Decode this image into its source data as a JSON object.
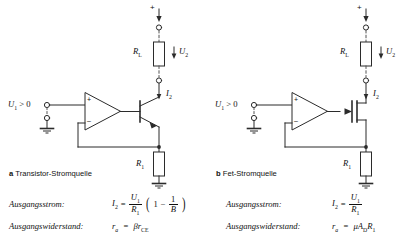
{
  "figure": {
    "panels": [
      {
        "id": "a",
        "marker": "a",
        "caption": "Transistor-Stromquelle",
        "supply_label": "+",
        "load_resistor": "R",
        "load_resistor_sub": "L",
        "load_voltage": "U",
        "load_voltage_sub": "2",
        "output_current": "I",
        "output_current_sub": "2",
        "input_label": "U",
        "input_label_sub": "1",
        "input_condition": "> 0",
        "opamp_plus": "+",
        "opamp_minus": "–",
        "emitter_resistor": "R",
        "emitter_resistor_sub": "1",
        "device": "npn-transistor"
      },
      {
        "id": "b",
        "marker": "b",
        "caption": "Fet-Stromquelle",
        "supply_label": "+",
        "load_resistor": "R",
        "load_resistor_sub": "L",
        "load_voltage": "U",
        "load_voltage_sub": "2",
        "output_current": "I",
        "output_current_sub": "2",
        "input_label": "U",
        "input_label_sub": "1",
        "input_condition": "> 0",
        "opamp_plus": "+",
        "opamp_minus": "–",
        "source_resistor": "R",
        "source_resistor_sub": "1",
        "device": "n-channel-fet"
      }
    ],
    "equations": {
      "left": {
        "row1_label": "Ausgangsstrom:",
        "row1_lhs": "I",
        "row1_lhs_sub": "2",
        "row1_eq": "=",
        "row1_num": "U",
        "row1_num_sub": "1",
        "row1_den": "R",
        "row1_den_sub": "1",
        "row1_paren_open": "(",
        "row1_one": "1",
        "row1_minus": "−",
        "row1_frac2_num": "1",
        "row1_frac2_den": "B",
        "row1_paren_close": ")",
        "row2_label": "Ausgangswiderstand:",
        "row2_lhs": "r",
        "row2_lhs_sub": "a",
        "row2_eq": "=",
        "row2_rhs": "βr",
        "row2_rhs_sub": "CE"
      },
      "right": {
        "row1_label": "Ausgangsstrom:",
        "row1_lhs": "I",
        "row1_lhs_sub": "2",
        "row1_eq": "=",
        "row1_num": "U",
        "row1_num_sub": "1",
        "row1_den": "R",
        "row1_den_sub": "1",
        "row2_label": "Ausgangswiderstand:",
        "row2_lhs": "r",
        "row2_lhs_sub": "a",
        "row2_eq": "=",
        "row2_rhs_mu": "μA",
        "row2_rhs_sub": "D",
        "row2_rhs_tail": "R",
        "row2_rhs_tail_sub": "1"
      }
    },
    "colors": {
      "line": "#2b2b2b",
      "dashed": "#555555",
      "text": "#111111",
      "background": "#ffffff"
    }
  }
}
